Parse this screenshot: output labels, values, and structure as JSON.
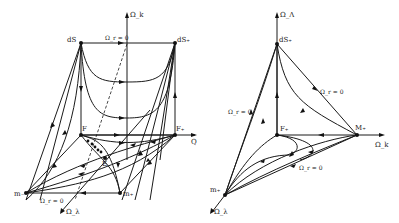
{
  "left_diagram": {
    "axis_labels": {
      "vertical": "Ω_k",
      "right": "Q",
      "front": "Ω_λ"
    },
    "nodes": {
      "top_left": "dS",
      "top_right": "dS₊",
      "mid_left": "F",
      "mid_right": "F₊",
      "center": "E",
      "bottom_left": "m₋",
      "bottom_right": "m₊"
    },
    "annotations": {
      "top_edge": "Ω_r = 0",
      "bottom_edge": "Ω_r = 0"
    }
  },
  "right_diagram": {
    "axis_labels": {
      "vertical": "Ω_Λ",
      "right": "Ω_k",
      "front": "Ω_λ"
    },
    "nodes": {
      "top": "dS₊",
      "middle": "F₊",
      "right": "M₊",
      "bottom": "m₊"
    },
    "annotations": {
      "upper_right_edge": "Ω_r = 0",
      "left_edge": "Ω_r = 0",
      "bottom_edge": "Ω_r = 0"
    }
  }
}
